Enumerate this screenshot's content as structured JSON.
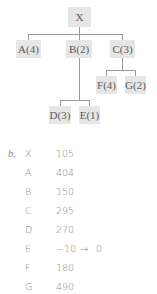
{
  "tree": {
    "root": {
      "label": "X"
    },
    "level1": [
      {
        "label": "A(4)"
      },
      {
        "label": "B(2)"
      },
      {
        "label": "C(3)"
      }
    ],
    "c_children": [
      {
        "label": "F(4)"
      },
      {
        "label": "G(2)"
      }
    ],
    "b_children": [
      {
        "label": "D(3)"
      },
      {
        "label": "E(1)"
      }
    ]
  },
  "values": {
    "part_label": "b.",
    "rows": [
      {
        "node": "X",
        "value": "105",
        "arrow": "",
        "result": ""
      },
      {
        "node": "A",
        "value": "404",
        "arrow": "",
        "result": ""
      },
      {
        "node": "B",
        "value": "150",
        "arrow": "",
        "result": ""
      },
      {
        "node": "C",
        "value": "295",
        "arrow": "",
        "result": ""
      },
      {
        "node": "D",
        "value": "270",
        "arrow": "",
        "result": ""
      },
      {
        "node": "E",
        "value": "−10",
        "arrow": "→",
        "result": "0"
      },
      {
        "node": "F",
        "value": "180",
        "arrow": "",
        "result": ""
      },
      {
        "node": "G",
        "value": "490",
        "arrow": "",
        "result": ""
      }
    ]
  },
  "colors": {
    "node_fill": "#e6e6e6",
    "line": "#9a9a9a",
    "text": "#5a5a5a"
  }
}
